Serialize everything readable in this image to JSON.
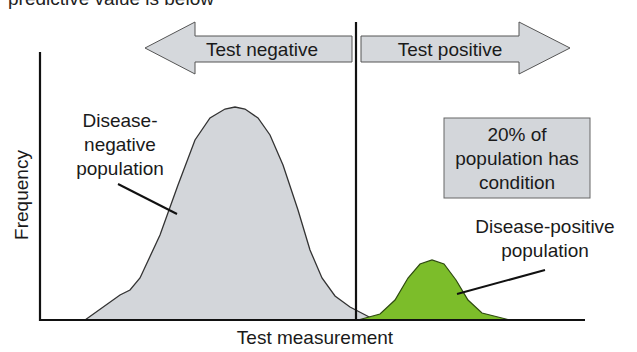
{
  "header": {
    "cropped_text": "predictive value is below"
  },
  "diagram": {
    "arrows": {
      "negative_label": "Test negative",
      "positive_label": "Test positive"
    },
    "axes": {
      "ylabel": "Frequency",
      "xlabel": "Test measurement"
    },
    "distributions": {
      "negative": {
        "label_lines": [
          "Disease-",
          "negative",
          "population"
        ],
        "color": "#d3d6da"
      },
      "positive": {
        "label_lines": [
          "Disease-positive",
          "population"
        ],
        "color": "#7cbd2a"
      }
    },
    "info_box": {
      "lines": [
        "20% of",
        "population has",
        "condition"
      ],
      "color": "#d3d6da"
    },
    "colors": {
      "arrow_fill": "#d5d8dc",
      "outline": "#333333",
      "axis": "#111111"
    }
  }
}
